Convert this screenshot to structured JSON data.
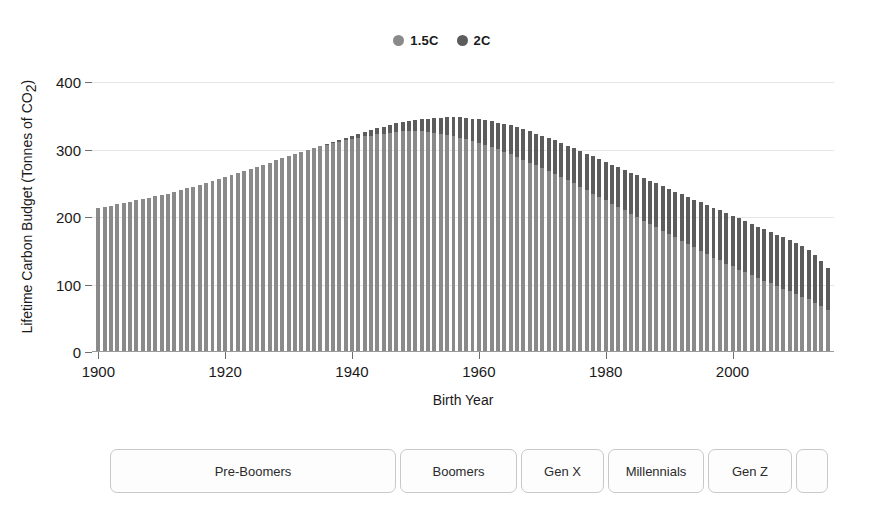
{
  "chart_data": {
    "type": "bar",
    "title": "",
    "xlabel": "Birth Year",
    "ylabel": "Lifetime Carbon Budget (Tonnes of CO2)",
    "ylabel_parts": {
      "main": "Lifetime Carbon Budget (Tonnes of CO",
      "sub": "2",
      "tail": ")"
    },
    "xlim": [
      1899,
      2016
    ],
    "ylim": [
      0,
      430
    ],
    "grid": true,
    "legend_position": "top-center",
    "yticks": [
      0,
      100,
      200,
      300,
      400
    ],
    "xticks": [
      1900,
      1920,
      1940,
      1960,
      1980,
      2000
    ],
    "colors": {
      "series_1_5C": "#8a8a8a",
      "series_2C": "#5c5c5c",
      "grid": "#e6e6e6",
      "axis": "#6e6e6e"
    },
    "legend": [
      {
        "label": "1.5C",
        "color": "#8a8a8a"
      },
      {
        "label": "2C",
        "color": "#5c5c5c"
      }
    ],
    "x": [
      1900,
      1901,
      1902,
      1903,
      1904,
      1905,
      1906,
      1907,
      1908,
      1909,
      1910,
      1911,
      1912,
      1913,
      1914,
      1915,
      1916,
      1917,
      1918,
      1919,
      1920,
      1921,
      1922,
      1923,
      1924,
      1925,
      1926,
      1927,
      1928,
      1929,
      1930,
      1931,
      1932,
      1933,
      1934,
      1935,
      1936,
      1937,
      1938,
      1939,
      1940,
      1941,
      1942,
      1943,
      1944,
      1945,
      1946,
      1947,
      1948,
      1949,
      1950,
      1951,
      1952,
      1953,
      1954,
      1955,
      1956,
      1957,
      1958,
      1959,
      1960,
      1961,
      1962,
      1963,
      1964,
      1965,
      1966,
      1967,
      1968,
      1969,
      1970,
      1971,
      1972,
      1973,
      1974,
      1975,
      1976,
      1977,
      1978,
      1979,
      1980,
      1981,
      1982,
      1983,
      1984,
      1985,
      1986,
      1987,
      1988,
      1989,
      1990,
      1991,
      1992,
      1993,
      1994,
      1995,
      1996,
      1997,
      1998,
      1999,
      2000,
      2001,
      2002,
      2003,
      2004,
      2005,
      2006,
      2007,
      2008,
      2009,
      2010,
      2011,
      2012,
      2013,
      2014,
      2015
    ],
    "series": [
      {
        "name": "1.5C",
        "color": "#8a8a8a",
        "values": [
          213,
          215,
          217,
          219,
          221,
          223,
          225,
          227,
          229,
          231,
          233,
          235,
          238,
          240,
          243,
          245,
          248,
          251,
          254,
          257,
          260,
          263,
          266,
          269,
          272,
          275,
          278,
          281,
          284,
          287,
          290,
          293,
          296,
          299,
          302,
          305,
          307,
          310,
          312,
          314,
          316,
          318,
          320,
          321,
          323,
          324,
          325,
          326,
          327,
          327,
          327,
          327,
          326,
          325,
          324,
          322,
          320,
          318,
          316,
          313,
          310,
          307,
          304,
          301,
          297,
          293,
          289,
          285,
          281,
          277,
          273,
          269,
          264,
          260,
          255,
          250,
          245,
          240,
          235,
          230,
          225,
          220,
          215,
          210,
          205,
          200,
          195,
          190,
          185,
          180,
          175,
          170,
          165,
          160,
          155,
          150,
          145,
          140,
          136,
          131,
          127,
          122,
          118,
          114,
          110,
          106,
          102,
          98,
          94,
          90,
          86,
          82,
          78,
          73,
          68,
          62
        ]
      },
      {
        "name": "2C",
        "color": "#5c5c5c",
        "values": [
          213,
          215,
          217,
          219,
          221,
          223,
          225,
          227,
          229,
          231,
          233,
          235,
          238,
          240,
          243,
          245,
          248,
          251,
          254,
          257,
          260,
          263,
          266,
          269,
          272,
          275,
          278,
          281,
          284,
          287,
          290,
          293,
          296,
          299,
          302,
          305,
          308,
          311,
          314,
          317,
          320,
          323,
          326,
          329,
          332,
          334,
          337,
          339,
          341,
          343,
          344,
          345,
          346,
          347,
          347,
          348,
          348,
          348,
          347,
          346,
          345,
          344,
          342,
          340,
          338,
          336,
          333,
          330,
          327,
          324,
          321,
          317,
          314,
          310,
          306,
          302,
          298,
          294,
          290,
          286,
          282,
          278,
          274,
          270,
          266,
          262,
          258,
          254,
          250,
          246,
          242,
          238,
          234,
          230,
          226,
          222,
          218,
          214,
          210,
          206,
          202,
          198,
          194,
          190,
          186,
          182,
          178,
          174,
          170,
          166,
          162,
          157,
          151,
          144,
          135,
          124
        ]
      }
    ]
  },
  "generations": {
    "items": [
      {
        "label": "Pre-Boomers",
        "width": 286
      },
      {
        "label": "Boomers",
        "width": 117
      },
      {
        "label": "Gen X",
        "width": 83
      },
      {
        "label": "Millennials",
        "width": 96
      },
      {
        "label": "Gen Z",
        "width": 84
      },
      {
        "label": "",
        "width": 32
      }
    ]
  }
}
